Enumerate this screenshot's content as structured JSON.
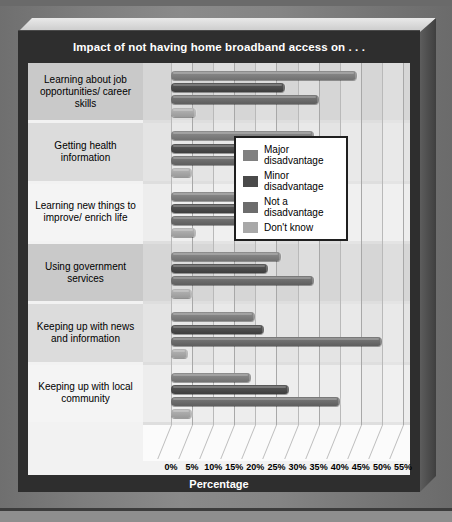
{
  "chart_title": "Impact of not having home broadband access on . . .",
  "axis_title": "Percentage",
  "legend": {
    "items": [
      {
        "label": "Major disadvantage",
        "color": "#808080"
      },
      {
        "label": "Minor disadvantage",
        "color": "#4a4a4a"
      },
      {
        "label": "Not a disadvantage",
        "color": "#6c6c6c"
      },
      {
        "label": "Don't know",
        "color": "#a8a8a8"
      }
    ]
  },
  "chart_data": {
    "type": "bar",
    "orientation": "horizontal",
    "title": "Impact of not having home broadband access on . . .",
    "xlabel": "Percentage",
    "ylabel": "",
    "xlim": [
      0,
      55
    ],
    "xticks": [
      0,
      5,
      10,
      15,
      20,
      25,
      30,
      35,
      40,
      45,
      50,
      55
    ],
    "xtick_labels": [
      "0%",
      "5%",
      "10%",
      "15%",
      "20%",
      "25%",
      "30%",
      "35%",
      "40%",
      "45%",
      "50%",
      "55%"
    ],
    "grid": true,
    "legend_position": "center-right",
    "categories": [
      "Learning about job opportunities/ career skills",
      "Getting health information",
      "Learning new things to improve/ enrich life",
      "Using government services",
      "Keeping up with news and information",
      "Keeping up with local community"
    ],
    "series": [
      {
        "name": "Major disadvantage",
        "values": [
          44,
          34,
          30,
          26,
          20,
          19
        ]
      },
      {
        "name": "Minor disadvantage",
        "values": [
          27,
          28,
          30,
          23,
          22,
          28
        ]
      },
      {
        "name": "Not a disadvantage",
        "values": [
          35,
          35,
          31,
          34,
          50,
          40
        ]
      },
      {
        "name": "Don't know",
        "values": [
          6,
          5,
          6,
          5,
          4,
          5
        ]
      }
    ]
  }
}
